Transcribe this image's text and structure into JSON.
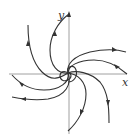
{
  "diagram": {
    "type": "phase-portrait",
    "axes": {
      "x_label": "x",
      "y_label": "y"
    },
    "trajectory_count": 8,
    "colors": {
      "curve": "#333333",
      "axis": "#888888",
      "background": "#ffffff"
    }
  }
}
